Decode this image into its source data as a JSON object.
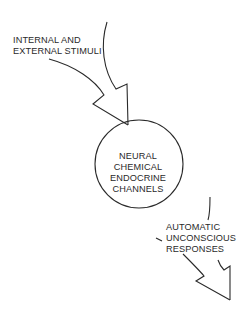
{
  "diagram": {
    "input": {
      "lines": [
        "INTERNAL AND",
        "EXTERNAL STIMULI"
      ]
    },
    "process": {
      "shape": "circle",
      "lines": [
        "NEURAL",
        "CHEMICAL",
        "ENDOCRINE",
        "CHANNELS"
      ]
    },
    "output": {
      "lines": [
        "AUTOMATIC",
        "UNCONSCIOUS",
        "RESPONSES"
      ]
    },
    "edges": [
      {
        "from": "input",
        "to": "process",
        "style": "curved-hollow-arrow"
      },
      {
        "from": "process",
        "to": "output",
        "style": "curved-hollow-arrow"
      }
    ],
    "colors": {
      "stroke": "#2a2a2a",
      "background": "#ffffff"
    }
  }
}
